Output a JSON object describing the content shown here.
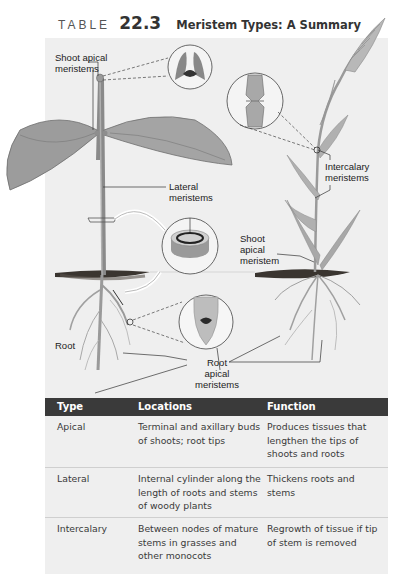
{
  "title": {
    "label": "TABLE",
    "number": "22.3",
    "name": "Meristem Types: A Summary"
  },
  "diagram": {
    "labels": {
      "shoot_apical_meristems": [
        "Shoot apical",
        "meristems"
      ],
      "lateral_meristems": [
        "Lateral",
        "meristems"
      ],
      "intercalary_meristems": [
        "Intercalary",
        "meristems"
      ],
      "shoot_apical_meristem": [
        "Shoot",
        "apical",
        "meristem"
      ],
      "root": "Root",
      "root_apical_meristems": [
        "Root",
        "apical",
        "meristems"
      ]
    }
  },
  "table": {
    "headers": [
      "Type",
      "Locations",
      "Function"
    ],
    "rows": [
      {
        "type": "Apical",
        "locations": "Terminal and axillary buds of shoots; root tips",
        "function": "Produces tissues that lengthen the tips of shoots and roots"
      },
      {
        "type": "Lateral",
        "locations": "Internal cylinder along the length of roots and stems of woody plants",
        "function": "Thickens roots and stems"
      },
      {
        "type": "Intercalary",
        "locations": "Between nodes of mature stems in grasses and other monocots",
        "function": "Regrowth of tissue if tip of stem is removed"
      }
    ]
  },
  "colors": {
    "panel_bg": "#efefef",
    "header_bg": "#3a3a3a",
    "header_text": "#ffffff",
    "row_divider": "#cfcfcf"
  }
}
